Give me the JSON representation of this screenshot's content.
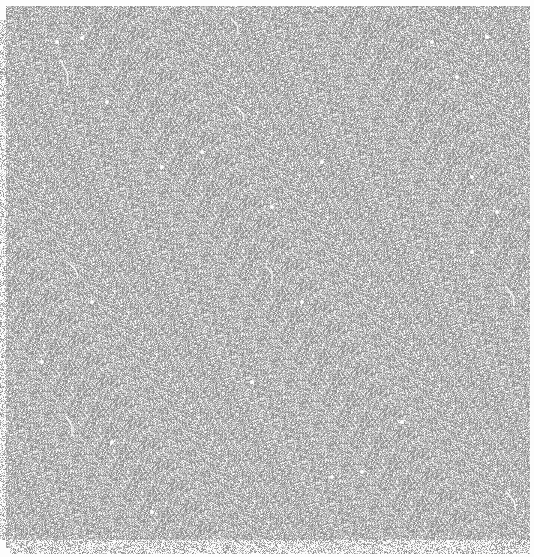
{
  "image": {
    "description": "Dense gray stippled lattice texture with scattered white specks and thin crack-like white lines",
    "colors": {
      "background": "#fdfdfd",
      "texture_dark": "#8a8a8a",
      "texture_mid": "#b4b4b4",
      "texture_light": "#d6d6d6",
      "speck": "#ffffff"
    }
  }
}
